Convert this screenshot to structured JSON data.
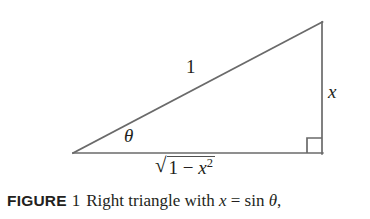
{
  "figure": {
    "background_color": "#ffffff",
    "stroke_color": "#6a6a6a",
    "text_color": "#231f20"
  },
  "diagram": {
    "type": "right-triangle",
    "vertices": {
      "left": [
        73,
        153
      ],
      "apex": [
        322,
        22
      ],
      "right_angle": [
        322,
        153
      ]
    },
    "right_angle_marker_size": 15,
    "labels": {
      "hypotenuse": "1",
      "opposite": "x",
      "angle": "θ",
      "adjacent_radical": "√",
      "adjacent_radicand_base": "1 − x",
      "adjacent_radicand_exponent": "2"
    }
  },
  "caption": {
    "label": "FIGURE",
    "number": "1",
    "text_before_var": "Right triangle with ",
    "variable": "x",
    "equals": " = ",
    "function": "sin ",
    "angle": "θ",
    "trailing": ","
  }
}
